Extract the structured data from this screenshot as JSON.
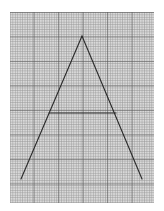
{
  "scene": {
    "description": "Graph paper with a hand-drawn letter A",
    "paper": {
      "x": 10,
      "y": 12,
      "width": 144,
      "height": 191,
      "background_color": "#d9d9d9",
      "minor_grid_color": "#969696",
      "major_grid_color": "#5a5a5a"
    },
    "letter_a": {
      "stroke_color": "#2a2a2a",
      "apex": [
        82,
        36
      ],
      "left_foot": [
        21,
        179
      ],
      "right_foot": [
        142,
        179
      ],
      "crossbar": {
        "x1": 49,
        "y1": 113,
        "x2": 116,
        "y2": 113
      }
    }
  }
}
